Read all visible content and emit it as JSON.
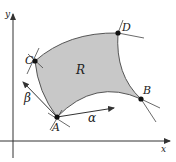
{
  "diagram": {
    "type": "curvilinear-region",
    "axes": {
      "x_label": "x",
      "y_label": "y"
    },
    "region": {
      "label": "R",
      "fill": "#c8c8c8"
    },
    "points": [
      {
        "id": "A",
        "label": "A"
      },
      {
        "id": "B",
        "label": "B"
      },
      {
        "id": "C",
        "label": "C"
      },
      {
        "id": "D",
        "label": "D"
      }
    ],
    "vectors": [
      {
        "label": "α",
        "from": "A",
        "direction": "right"
      },
      {
        "label": "β",
        "from": "A",
        "direction": "up-left"
      }
    ],
    "colors": {
      "stroke": "#333333",
      "region_fill": "#c8c8c8",
      "region_edge": "#555555"
    }
  }
}
